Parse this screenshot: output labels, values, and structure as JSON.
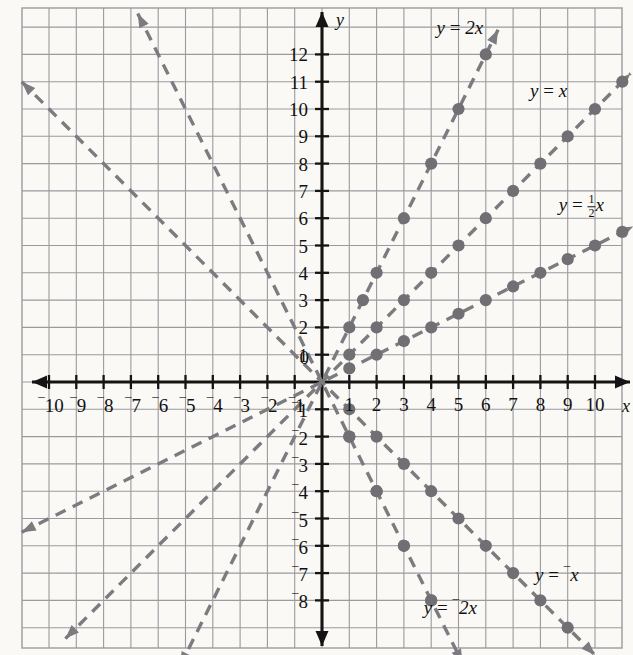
{
  "chart_data": {
    "type": "line",
    "title": "",
    "xlabel": "x",
    "ylabel": "y",
    "xlim": [
      -11.0,
      11.4
    ],
    "ylim": [
      -9.7,
      13.6
    ],
    "grid": true,
    "legend_position": "inline-annotations",
    "x_ticks": [
      -10,
      -9,
      -8,
      -7,
      -6,
      -5,
      -4,
      -3,
      -2,
      -1,
      1,
      2,
      3,
      4,
      5,
      6,
      7,
      8,
      9,
      10
    ],
    "x_tick_labels": [
      "⁻10",
      "⁻9",
      "⁻8",
      "⁻7",
      "⁻6",
      "⁻5",
      "⁻4",
      "⁻3",
      "⁻2",
      "⁻1",
      "1",
      "2",
      "3",
      "4",
      "5",
      "6",
      "7",
      "8",
      "9",
      "10"
    ],
    "y_ticks": [
      12,
      11,
      10,
      9,
      8,
      7,
      6,
      5,
      4,
      3,
      2,
      1,
      -1,
      -2,
      -3,
      -4,
      -5,
      -6,
      -7,
      -8
    ],
    "y_tick_labels": [
      "12",
      "11",
      "10",
      "9",
      "8",
      "7",
      "6",
      "5",
      "4",
      "3",
      "2",
      "1",
      "⁻1",
      "⁻2",
      "⁻3",
      "⁻4",
      "⁻5",
      "⁻6",
      "⁻7",
      "⁻8"
    ],
    "origin_label": "0",
    "series": [
      {
        "name": "y = 2x",
        "slope": 2,
        "label_html": "y = 2x",
        "label_x": 5.05,
        "label_y": 13.0,
        "color": "#7b7b80",
        "style": "dashed",
        "arrows": "both",
        "line_from": [
          -5.2,
          -10.4
        ],
        "line_to": [
          6.45,
          12.9
        ],
        "points": [
          [
            1,
            2
          ],
          [
            1.5,
            3
          ],
          [
            2,
            4
          ],
          [
            3,
            6
          ],
          [
            4,
            8
          ],
          [
            5,
            10
          ],
          [
            6,
            12
          ],
          [
            1,
            -2
          ],
          [
            2,
            -4
          ],
          [
            3,
            -6
          ],
          [
            4,
            -8
          ]
        ],
        "point_note": "dots only on right side (quadrant I and IV)"
      },
      {
        "name": "y = x",
        "slope": 1,
        "label_html": "y = x",
        "label_x": 8.3,
        "label_y": 10.7,
        "color": "#7b7b80",
        "style": "dashed",
        "arrows": "both",
        "line_from": [
          -9.4,
          -9.4
        ],
        "line_to": [
          11.3,
          11.3
        ],
        "points": [
          [
            1,
            1
          ],
          [
            2,
            2
          ],
          [
            3,
            3
          ],
          [
            4,
            4
          ],
          [
            5,
            5
          ],
          [
            6,
            6
          ],
          [
            7,
            7
          ],
          [
            8,
            8
          ],
          [
            9,
            9
          ],
          [
            10,
            10
          ],
          [
            11,
            11
          ]
        ]
      },
      {
        "name": "y = 1/2 x",
        "slope": 0.5,
        "label_html": "y = ½x",
        "label_x": 9.5,
        "label_y": 6.4,
        "color": "#7b7b80",
        "style": "dashed",
        "arrows": "both",
        "line_from": [
          -11.0,
          -5.5
        ],
        "line_to": [
          11.4,
          5.7
        ],
        "points": [
          [
            1,
            0.5
          ],
          [
            2,
            1
          ],
          [
            3,
            1.5
          ],
          [
            4,
            2
          ],
          [
            5,
            2.5
          ],
          [
            6,
            3
          ],
          [
            7,
            3.5
          ],
          [
            8,
            4
          ],
          [
            9,
            4.5
          ],
          [
            10,
            5
          ],
          [
            11,
            5.5
          ]
        ]
      },
      {
        "name": "y = -x",
        "slope": -1,
        "label_html": "y = ⁻x",
        "label_x": 8.6,
        "label_y": -7.0,
        "color": "#7b7b80",
        "style": "dashed",
        "arrows": "both",
        "line_from": [
          -11.0,
          11.0
        ],
        "line_to": [
          10.0,
          -10.0
        ],
        "points": [
          [
            1,
            -1
          ],
          [
            2,
            -2
          ],
          [
            3,
            -3
          ],
          [
            4,
            -4
          ],
          [
            5,
            -5
          ],
          [
            6,
            -6
          ],
          [
            7,
            -7
          ],
          [
            8,
            -8
          ],
          [
            9,
            -9
          ]
        ]
      },
      {
        "name": "y = -2x",
        "slope": -2,
        "label_html": "y = ⁻2x",
        "label_x": 4.7,
        "label_y": -8.2,
        "color": "#7b7b80",
        "style": "dashed",
        "arrows": "both",
        "line_from": [
          -6.75,
          13.5
        ],
        "line_to": [
          5.15,
          -10.3
        ],
        "points": [
          [
            1,
            -2
          ],
          [
            2,
            -4
          ],
          [
            3,
            -6
          ],
          [
            4,
            -8
          ]
        ]
      }
    ],
    "colors": {
      "background": "#faf9f6",
      "grid": "#9a9a9f",
      "axis": "#141414",
      "line": "#7b7b80",
      "point": "#6f6f74",
      "text": "#111111"
    }
  }
}
